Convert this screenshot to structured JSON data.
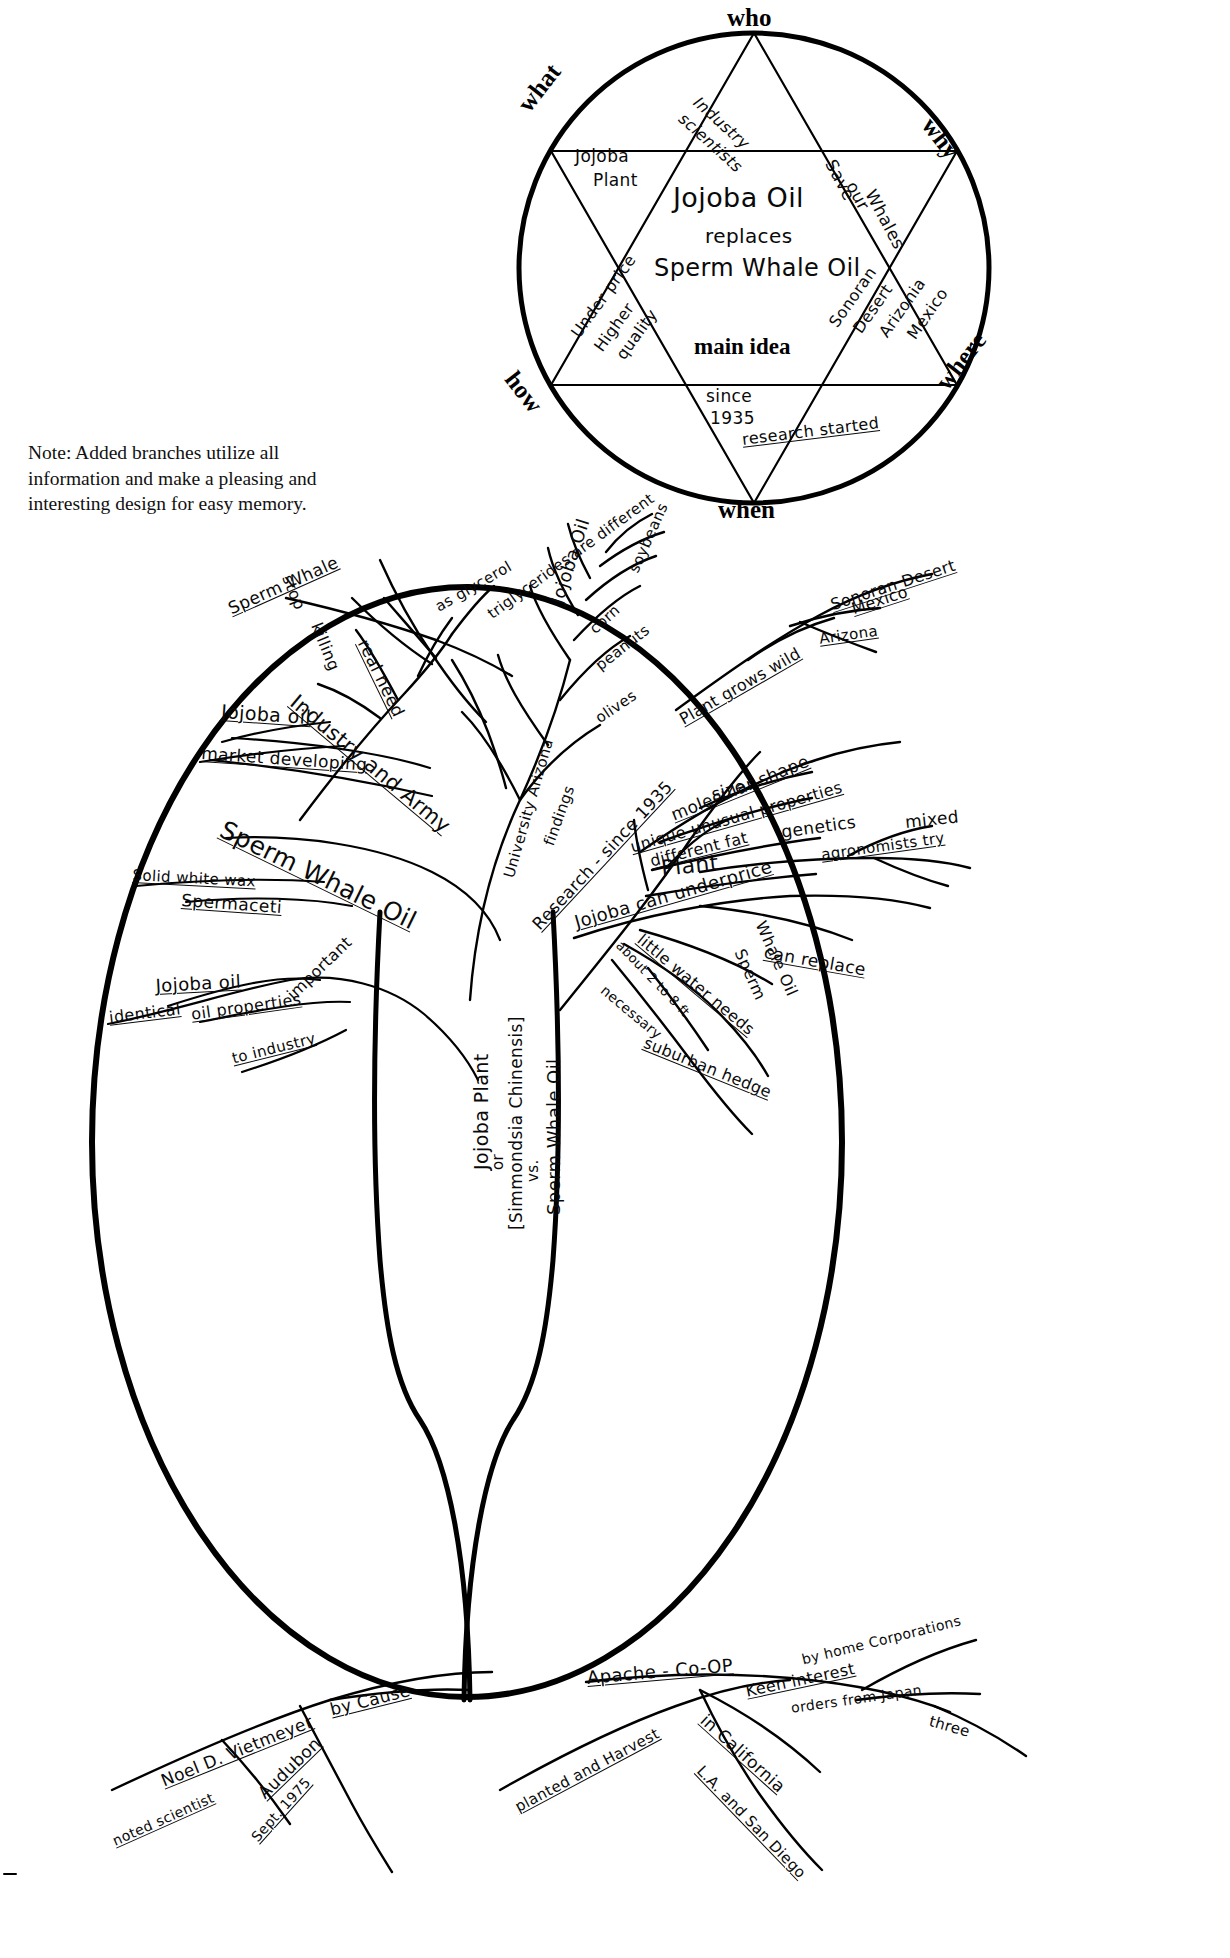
{
  "document": {
    "kind": "hand-drawn mind map worksheet",
    "note": "Note: Added branches utilize all information and make a pleasing and interesting design for easy memory."
  },
  "star_diagram": {
    "main_idea_label": "main idea",
    "center_text": [
      "Jojoba Oil",
      "replaces",
      "Sperm Whale Oil"
    ],
    "points": [
      {
        "key": "who",
        "label": "who",
        "content": "Industry scientists"
      },
      {
        "key": "what",
        "label": "what",
        "content": "Jojoba Plant"
      },
      {
        "key": "why",
        "label": "why",
        "content": "Save our Whales"
      },
      {
        "key": "where",
        "label": "where",
        "content": "Sonoran Desert Arizona Mexico"
      },
      {
        "key": "when",
        "label": "when",
        "content": "since 1935"
      },
      {
        "key": "how",
        "label": "how",
        "content": "Under price Higher quality"
      }
    ],
    "who_text": "Industry scientists",
    "what_text_1": "Jojoba",
    "what_text_2": "Plant",
    "why_text_1": "Save",
    "why_text_2": "our",
    "why_text_3": "Whales",
    "where_text_1": "Sonoran",
    "where_text_2": "Desert",
    "where_text_3": "Arizonia",
    "where_text_4": "Mexico",
    "when_text_1": "since",
    "when_text_2": "1935",
    "when_text_3": "research started",
    "how_text_1": "Under price",
    "how_text_2": "Higher",
    "how_text_3": "quality"
  },
  "tree": {
    "trunk_text": [
      "Jojoba Plant",
      "or",
      "[Simmondsia Chinensis]",
      "vs.",
      "Sperm Whale Oil"
    ],
    "branches": {
      "upper_left": [
        "Sperm Whale",
        "stop",
        "killing",
        "real need",
        "Jojoba oil",
        "market developing",
        "Industry and Army"
      ],
      "left": [
        "Sperm Whale Oil",
        "Solid white wax",
        "Spermaceti",
        "Jojoba oil",
        "identical",
        "oil properties",
        "important",
        "to industry"
      ],
      "top_center": [
        "as glycerol",
        "Jojoba Oil",
        "triglycerides are different",
        "soybeans",
        "corn",
        "peanuts",
        "olives",
        "University Arizona",
        "findings",
        "Research - since 1935"
      ],
      "right": [
        "Plant grows wild",
        "Sonoran Desert",
        "Mexico",
        "Arizona",
        "molecular shape",
        "size",
        "unique unusual properties",
        "different fat",
        "Plant",
        "genetics",
        "mixed",
        "agronomists try",
        "Jojoba can underprice",
        "can replace",
        "Whale Oil",
        "Sperm",
        "little water needs",
        "about 2 to 8 ft.",
        "necessary",
        "suburban hedge"
      ],
      "bottom_left": [
        "Noel D. Vietmeyer",
        "noted scientist",
        "Audubon",
        "Sept. 1975",
        "by Cause"
      ],
      "bottom_right": [
        "Apache - Co-OP",
        "planted and Harvest",
        "in California",
        "L.A. and San Diego",
        "Keen interest",
        "by home Corporations",
        "orders from Japan",
        "three"
      ]
    }
  }
}
